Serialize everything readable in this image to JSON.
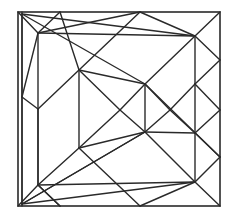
{
  "diagram": {
    "type": "geometric-line-drawing",
    "stroke_color": "#2a2a2a",
    "background": "#ffffff",
    "outer_square": {
      "x": 18,
      "y": 12,
      "w": 202,
      "h": 194
    },
    "lines": [
      [
        22,
        12,
        22,
        206
      ],
      [
        18,
        12,
        38,
        33
      ],
      [
        60,
        12,
        38,
        33
      ],
      [
        140,
        12,
        38,
        33
      ],
      [
        22,
        14,
        145,
        84
      ],
      [
        22,
        14,
        195,
        36
      ],
      [
        22,
        14,
        22,
        97
      ],
      [
        38,
        33,
        195,
        36
      ],
      [
        38,
        33,
        38,
        185
      ],
      [
        38,
        33,
        22,
        97
      ],
      [
        60,
        12,
        79,
        70
      ],
      [
        140,
        12,
        79,
        70
      ],
      [
        140,
        12,
        195,
        36
      ],
      [
        220,
        12,
        195,
        36
      ],
      [
        79,
        70,
        145,
        84
      ],
      [
        79,
        70,
        79,
        148
      ],
      [
        79,
        70,
        120,
        110
      ],
      [
        79,
        70,
        38,
        109
      ],
      [
        195,
        36,
        145,
        84
      ],
      [
        195,
        36,
        195,
        84
      ],
      [
        195,
        36,
        220,
        60
      ],
      [
        145,
        84,
        145,
        132
      ],
      [
        145,
        84,
        120,
        110
      ],
      [
        145,
        84,
        170,
        110
      ],
      [
        145,
        84,
        220,
        157
      ],
      [
        220,
        60,
        195,
        84
      ],
      [
        195,
        84,
        170,
        110
      ],
      [
        195,
        84,
        220,
        110
      ],
      [
        195,
        84,
        195,
        133
      ],
      [
        220,
        110,
        195,
        133
      ],
      [
        170,
        110,
        195,
        133
      ],
      [
        120,
        110,
        145,
        132
      ],
      [
        120,
        110,
        79,
        148
      ],
      [
        170,
        110,
        145,
        132
      ],
      [
        195,
        133,
        145,
        132
      ],
      [
        195,
        133,
        220,
        157
      ],
      [
        195,
        133,
        195,
        182
      ],
      [
        145,
        132,
        195,
        182
      ],
      [
        145,
        132,
        79,
        148
      ],
      [
        145,
        132,
        22,
        204
      ],
      [
        220,
        157,
        195,
        182
      ],
      [
        79,
        148,
        38,
        185
      ],
      [
        79,
        148,
        140,
        206
      ],
      [
        38,
        109,
        38,
        185
      ],
      [
        22,
        97,
        38,
        109
      ],
      [
        22,
        97,
        22,
        204
      ],
      [
        38,
        185,
        195,
        182
      ],
      [
        38,
        185,
        18,
        206
      ],
      [
        38,
        185,
        60,
        206
      ],
      [
        22,
        204,
        195,
        182
      ],
      [
        195,
        182,
        140,
        206
      ],
      [
        195,
        182,
        220,
        206
      ],
      [
        22,
        204,
        145,
        132
      ],
      [
        60,
        206,
        38,
        185
      ]
    ]
  }
}
